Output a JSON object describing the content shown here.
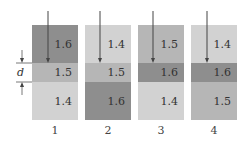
{
  "colors": {
    "n1.4": "#d2d2d2",
    "n1.5": "#b6b6b6",
    "n1.6": "#8e8e8e"
  },
  "thickness_label": "d",
  "columns": [
    {
      "label": "1",
      "layers": [
        "1.6",
        "1.5",
        "1.4"
      ]
    },
    {
      "label": "2",
      "layers": [
        "1.4",
        "1.5",
        "1.6"
      ]
    },
    {
      "label": "3",
      "layers": [
        "1.5",
        "1.6",
        "1.4"
      ]
    },
    {
      "label": "4",
      "layers": [
        "1.4",
        "1.6",
        "1.5"
      ]
    }
  ]
}
